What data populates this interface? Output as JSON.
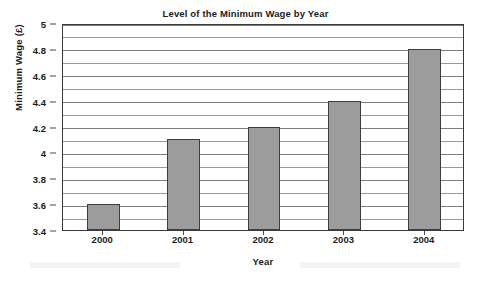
{
  "chart_data": {
    "type": "bar",
    "title": "Level of the Minimum Wage by Year",
    "xlabel": "Year",
    "ylabel": "Minimum Wage (£)",
    "categories": [
      "2000",
      "2001",
      "2002",
      "2003",
      "2004"
    ],
    "values": [
      3.6,
      4.1,
      4.2,
      4.4,
      4.8
    ],
    "ylim": [
      3.4,
      5
    ],
    "ytick_labels": [
      "3.4",
      "3.6",
      "3.8",
      "4",
      "4.2",
      "4.4",
      "4.6",
      "4.8",
      "5"
    ],
    "ytick_values": [
      3.4,
      3.6,
      3.8,
      4,
      4.2,
      4.4,
      4.6,
      4.8,
      5
    ],
    "minor_tick_step": 0.1,
    "grid": true,
    "legend": null,
    "series": [
      {
        "name": "Minimum Wage",
        "values": [
          3.6,
          4.1,
          4.2,
          4.4,
          4.8
        ],
        "color": "#9c9c9c",
        "border_color": "#3d3d3d"
      }
    ],
    "colors": {
      "bar_fill": "#9c9c9c",
      "bar_border": "#3d3d3d",
      "gridline": "#9a9a9a",
      "frame": "#3a3a3a",
      "text": "#1b1b1b",
      "background": "#ffffff"
    }
  }
}
